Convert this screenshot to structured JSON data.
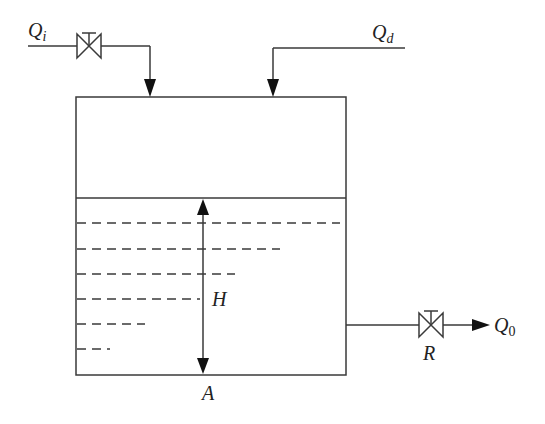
{
  "diagram": {
    "labels": {
      "inflow": "Q",
      "inflow_sub": "i",
      "disturbance": "Q",
      "disturbance_sub": "d",
      "outflow": "Q",
      "outflow_sub": "0",
      "height": "H",
      "area": "A",
      "resistance": "R"
    },
    "colors": {
      "stroke": "#3a3a3a",
      "fill": "#111111",
      "background": "#ffffff"
    }
  }
}
